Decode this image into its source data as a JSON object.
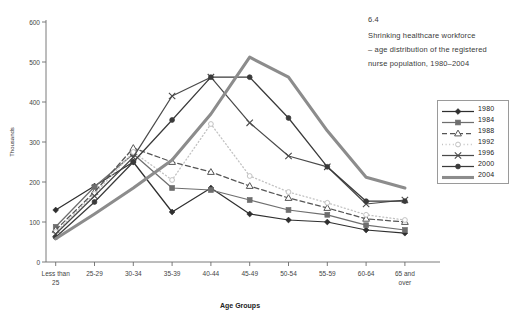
{
  "figure": {
    "number": "6.4",
    "caption_line1": "Shrinking healthcare workforce",
    "caption_line2": "– age distribution of the registered",
    "caption_line3": "nurse population, 1980–2004"
  },
  "legend": {
    "position": "right",
    "entries": [
      {
        "label": "1980",
        "marker": "diamond",
        "style": "solid",
        "color": "#2f2f2f"
      },
      {
        "label": "1984",
        "marker": "square",
        "style": "solid",
        "color": "#6e6e6e"
      },
      {
        "label": "1988",
        "marker": "triangle-open",
        "style": "dashed",
        "color": "#555555"
      },
      {
        "label": "1992",
        "marker": "circle-open",
        "style": "dotted",
        "color": "#c2c2c2"
      },
      {
        "label": "1996",
        "marker": "cross",
        "style": "solid",
        "color": "#4a4a4a"
      },
      {
        "label": "2000",
        "marker": "circle",
        "style": "solid",
        "color": "#3a3a3a"
      },
      {
        "label": "2004",
        "marker": "none",
        "style": "thick",
        "color": "#8c8c8c"
      }
    ]
  },
  "chart_data": {
    "type": "line",
    "title": "Shrinking healthcare workforce – age distribution of the registered nurse population, 1980–2004",
    "xlabel": "Age Groups",
    "ylabel": "Thousands",
    "ylim": [
      0,
      600
    ],
    "yticks": [
      0,
      100,
      200,
      300,
      400,
      500,
      600
    ],
    "grid": false,
    "categories": [
      "Less than 25",
      "25-29",
      "30-34",
      "35-39",
      "40-44",
      "45-49",
      "50-54",
      "55-59",
      "60-64",
      "65 and over"
    ],
    "series": [
      {
        "name": "1980",
        "values": [
          130,
          190,
          250,
          125,
          185,
          120,
          105,
          100,
          80,
          72
        ]
      },
      {
        "name": "1984",
        "values": [
          88,
          188,
          270,
          185,
          180,
          155,
          130,
          118,
          92,
          80
        ]
      },
      {
        "name": "1988",
        "values": [
          80,
          175,
          285,
          250,
          225,
          190,
          160,
          135,
          108,
          100
        ]
      },
      {
        "name": "1992",
        "values": [
          75,
          170,
          275,
          205,
          345,
          215,
          175,
          148,
          118,
          105
        ]
      },
      {
        "name": "1996",
        "values": [
          70,
          165,
          262,
          415,
          462,
          348,
          265,
          238,
          145,
          155
        ]
      },
      {
        "name": "2000",
        "values": [
          62,
          150,
          250,
          355,
          462,
          462,
          360,
          238,
          152,
          152
        ]
      },
      {
        "name": "2004",
        "values": [
          58,
          120,
          185,
          255,
          370,
          512,
          462,
          328,
          212,
          185
        ]
      }
    ]
  }
}
